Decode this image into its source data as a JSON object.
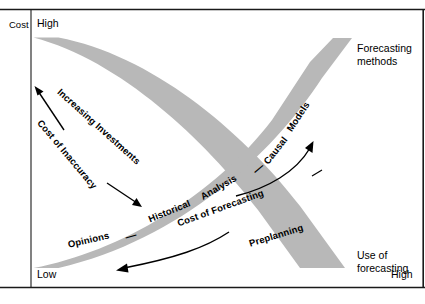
{
  "figure": {
    "axes": {
      "y_axis_title": "Cost",
      "y_axis_high": "High",
      "y_axis_low": "Low",
      "x_axis_high": "High"
    },
    "side_labels": {
      "top_right_line1": "Forecasting",
      "top_right_line2": "methods",
      "bottom_right_line1": "Use of",
      "bottom_right_line2": "forecasting"
    },
    "bands": [
      {
        "name": "descending-band",
        "color": "#b8b8b8",
        "labels": [
          "Increasing Investments"
        ],
        "annotations": [
          "Cost of Inaccuracy"
        ]
      },
      {
        "name": "ascending-band",
        "color": "#b8b8b8",
        "labels": [
          "Opinions",
          "Historical",
          "Analysis",
          "Causal",
          "Models",
          "Preplanning"
        ],
        "annotations": [
          "Cost of Forecasting"
        ]
      }
    ],
    "separators": {
      "dash": "—"
    },
    "arrows": [
      {
        "name": "cost-of-inaccuracy-arrow",
        "direction": "up-left"
      },
      {
        "name": "increasing-investments-arrow",
        "direction": "down-right"
      },
      {
        "name": "cost-of-forecasting-arrow-left",
        "direction": "down-left"
      },
      {
        "name": "cost-of-forecasting-arrow-right",
        "direction": "up-right"
      }
    ],
    "colors": {
      "band_fill": "#b8b8b8",
      "frame": "#1a1a1a",
      "text": "#000000"
    }
  }
}
